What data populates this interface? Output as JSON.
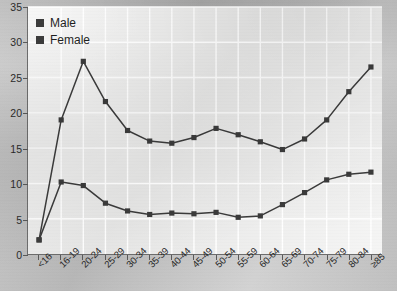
{
  "chart_data": {
    "type": "line",
    "title": "",
    "subtitle": "",
    "xlabel": "",
    "ylabel": "",
    "categories": [
      "<16",
      "16-19",
      "20-24",
      "25-29",
      "30-34",
      "35-39",
      "40-44",
      "45-49",
      "50-54",
      "55-59",
      "60-64",
      "65-69",
      "70-74",
      "75-79",
      "80-84",
      "≥85"
    ],
    "series": [
      {
        "name": "Male",
        "color": "#3b3b3b",
        "values": [
          2.0,
          19.0,
          27.3,
          21.6,
          17.5,
          16.0,
          15.7,
          16.5,
          17.8,
          16.9,
          15.9,
          14.8,
          16.3,
          19.0,
          23.0,
          26.5
        ]
      },
      {
        "name": "Female",
        "color": "#3b3b3b",
        "values": [
          2.0,
          10.2,
          9.7,
          7.2,
          6.1,
          5.6,
          5.8,
          5.7,
          5.9,
          5.2,
          5.4,
          7.0,
          8.7,
          10.5,
          11.3,
          11.6
        ]
      }
    ],
    "ylim": [
      0,
      35
    ],
    "yticks": [
      0,
      5,
      10,
      15,
      20,
      25,
      30,
      35
    ],
    "grid": true,
    "grid_color": "#ffffff",
    "legend_position": "top-left",
    "plot_background": "#ededec",
    "figure_background": "#c9c9c9",
    "marker": "square"
  },
  "legend": {
    "items": [
      {
        "label": "Male"
      },
      {
        "label": "Female"
      }
    ]
  }
}
